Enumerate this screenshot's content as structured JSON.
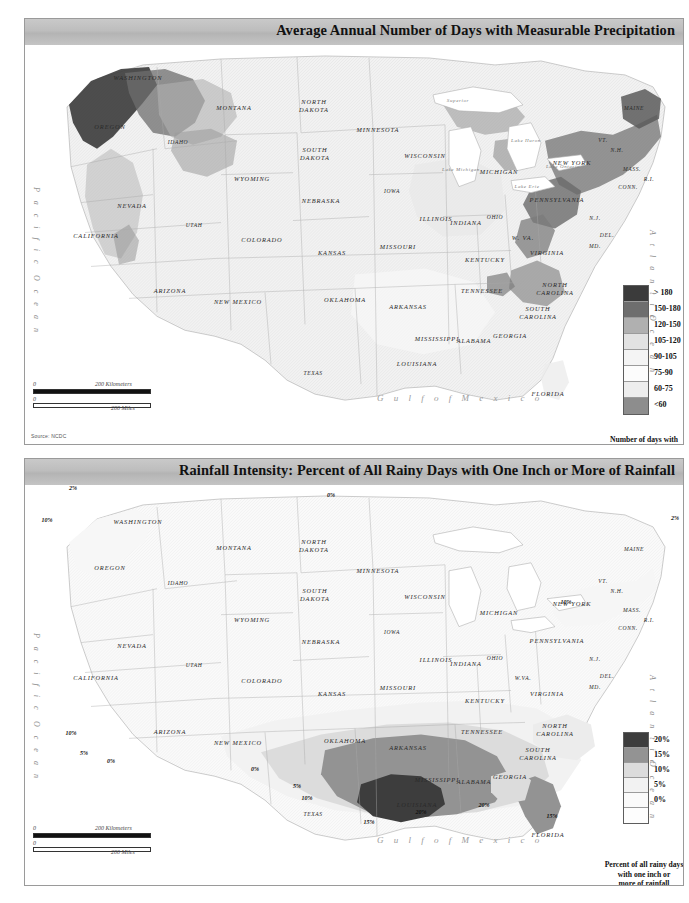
{
  "page": {
    "background": "#ffffff",
    "width": 689,
    "height": 903
  },
  "panels": [
    {
      "id": "precipitation-days",
      "title": "Average Annual Number of Days with Measurable Precipitation",
      "source": "Source: NCDC",
      "scale": {
        "zero": "0",
        "km": "200 Kilometers",
        "mi": "200 Miles"
      },
      "legend": {
        "caption": "Number of days with\nmeasurable precipitation",
        "bands": [
          {
            "label": "> 180",
            "color": "#3b3b3b"
          },
          {
            "label": "150-180",
            "color": "#6e6e6e"
          },
          {
            "label": "120-150",
            "color": "#b0b0b0"
          },
          {
            "label": "105-120",
            "color": "#e2e2e2"
          },
          {
            "label": "90-105",
            "color": "#f4f4f4"
          },
          {
            "label": "75-90",
            "color": "#fcfcfc"
          },
          {
            "label": "60-75",
            "color": "#ededed"
          },
          {
            "label": "<60",
            "color": "#8d8d8d"
          }
        ]
      }
    },
    {
      "id": "rainfall-intensity",
      "title": "Rainfall Intensity: Percent of All Rainy Days with One Inch or More of Rainfall",
      "source": "",
      "scale": {
        "zero": "0",
        "km": "200 Kilometers",
        "mi": "200 Miles"
      },
      "legend": {
        "caption": "Percent of all rainy days\nwith one inch or\nmore of rainfall",
        "bands": [
          {
            "label": "20%",
            "color": "#3d3d3d"
          },
          {
            "label": "15%",
            "color": "#939393"
          },
          {
            "label": "10%",
            "color": "#dcdcdc"
          },
          {
            "label": "5%",
            "color": "#f2f2f2"
          },
          {
            "label": "0%",
            "color": "#fafafa"
          },
          {
            "label": "",
            "color": "#fdfdfd"
          }
        ]
      }
    }
  ],
  "ocean_labels": {
    "pacific": "P a c i f i c",
    "atlantic": "A t l a n t i c",
    "ocean": "O c e a n",
    "gulf": "G u l f   o f   M e x i c o"
  },
  "states_top": [
    {
      "name": "WASHINGTON",
      "x": 113,
      "y": 32
    },
    {
      "name": "OREGON",
      "x": 85,
      "y": 81
    },
    {
      "name": "IDAHO",
      "x": 153,
      "y": 97
    },
    {
      "name": "MONTANA",
      "x": 209,
      "y": 62
    },
    {
      "name": "WYOMING",
      "x": 227,
      "y": 133
    },
    {
      "name": "NEVADA",
      "x": 107,
      "y": 160
    },
    {
      "name": "UTAH",
      "x": 169,
      "y": 180
    },
    {
      "name": "COLORADO",
      "x": 237,
      "y": 194
    },
    {
      "name": "CALIFORNIA",
      "x": 71,
      "y": 190
    },
    {
      "name": "ARIZONA",
      "x": 145,
      "y": 245
    },
    {
      "name": "NEW MEXICO",
      "x": 213,
      "y": 256
    },
    {
      "name": "TEXAS",
      "x": 288,
      "y": 328
    },
    {
      "name": "NORTH DAKOTA",
      "x": 289,
      "y": 60
    },
    {
      "name": "SOUTH DAKOTA",
      "x": 290,
      "y": 108
    },
    {
      "name": "NEBRASKA",
      "x": 296,
      "y": 155
    },
    {
      "name": "KANSAS",
      "x": 307,
      "y": 207
    },
    {
      "name": "OKLAHOMA",
      "x": 320,
      "y": 254
    },
    {
      "name": "MINNESOTA",
      "x": 353,
      "y": 84
    },
    {
      "name": "IOWA",
      "x": 367,
      "y": 146
    },
    {
      "name": "MISSOURI",
      "x": 373,
      "y": 201
    },
    {
      "name": "ARKANSAS",
      "x": 383,
      "y": 261
    },
    {
      "name": "LOUISIANA",
      "x": 392,
      "y": 318
    },
    {
      "name": "WISCONSIN",
      "x": 400,
      "y": 110
    },
    {
      "name": "ILLINOIS",
      "x": 411,
      "y": 173
    },
    {
      "name": "INDIANA",
      "x": 441,
      "y": 177
    },
    {
      "name": "MICHIGAN",
      "x": 474,
      "y": 126
    },
    {
      "name": "OHIO",
      "x": 470,
      "y": 172
    },
    {
      "name": "KENTUCKY",
      "x": 460,
      "y": 214
    },
    {
      "name": "TENNESSEE",
      "x": 457,
      "y": 245
    },
    {
      "name": "MISSISSIPPI",
      "x": 412,
      "y": 293
    },
    {
      "name": "ALABAMA",
      "x": 449,
      "y": 295
    },
    {
      "name": "GEORGIA",
      "x": 485,
      "y": 290
    },
    {
      "name": "FLORIDA",
      "x": 523,
      "y": 348
    },
    {
      "name": "SOUTH CAROLINA",
      "x": 513,
      "y": 267
    },
    {
      "name": "NORTH CAROLINA",
      "x": 530,
      "y": 243
    },
    {
      "name": "VIRGINIA",
      "x": 522,
      "y": 207
    },
    {
      "name": "W. VA.",
      "x": 498,
      "y": 192
    },
    {
      "name": "PENNSYLVANIA",
      "x": 532,
      "y": 154
    },
    {
      "name": "NEW YORK",
      "x": 547,
      "y": 117
    },
    {
      "name": "MAINE",
      "x": 609,
      "y": 63
    },
    {
      "name": "VT.",
      "x": 578,
      "y": 95
    },
    {
      "name": "N.H.",
      "x": 592,
      "y": 105
    },
    {
      "name": "MASS.",
      "x": 607,
      "y": 124
    },
    {
      "name": "CONN.",
      "x": 603,
      "y": 142
    },
    {
      "name": "R.I.",
      "x": 624,
      "y": 134
    },
    {
      "name": "N.J.",
      "x": 570,
      "y": 173
    },
    {
      "name": "DEL.",
      "x": 582,
      "y": 190
    },
    {
      "name": "MD.",
      "x": 570,
      "y": 201
    }
  ],
  "lakes_top": [
    {
      "name": "Superior",
      "x": 433,
      "y": 55
    },
    {
      "name": "Lake Michigan",
      "x": 436,
      "y": 124
    },
    {
      "name": "Lake Huron",
      "x": 501,
      "y": 95
    },
    {
      "name": "Lake Ontario",
      "x": 538,
      "y": 121
    },
    {
      "name": "Lake Erie",
      "x": 502,
      "y": 141
    }
  ],
  "states_bottom": [
    {
      "name": "WASHINGTON",
      "x": 113,
      "y": 36
    },
    {
      "name": "OREGON",
      "x": 85,
      "y": 82
    },
    {
      "name": "IDAHO",
      "x": 153,
      "y": 98
    },
    {
      "name": "MONTANA",
      "x": 209,
      "y": 62
    },
    {
      "name": "WYOMING",
      "x": 227,
      "y": 134
    },
    {
      "name": "NEVADA",
      "x": 107,
      "y": 160
    },
    {
      "name": "UTAH",
      "x": 169,
      "y": 180
    },
    {
      "name": "COLORADO",
      "x": 237,
      "y": 195
    },
    {
      "name": "CALIFORNIA",
      "x": 71,
      "y": 192
    },
    {
      "name": "ARIZONA",
      "x": 145,
      "y": 246
    },
    {
      "name": "NEW MEXICO",
      "x": 213,
      "y": 257
    },
    {
      "name": "TEXAS",
      "x": 288,
      "y": 329
    },
    {
      "name": "NORTH DAKOTA",
      "x": 289,
      "y": 60
    },
    {
      "name": "SOUTH DAKOTA",
      "x": 290,
      "y": 109
    },
    {
      "name": "NEBRASKA",
      "x": 296,
      "y": 156
    },
    {
      "name": "KANSAS",
      "x": 307,
      "y": 208
    },
    {
      "name": "OKLAHOMA",
      "x": 320,
      "y": 255
    },
    {
      "name": "MINNESOTA",
      "x": 353,
      "y": 85
    },
    {
      "name": "IOWA",
      "x": 367,
      "y": 147
    },
    {
      "name": "MISSOURI",
      "x": 373,
      "y": 202
    },
    {
      "name": "ARKANSAS",
      "x": 383,
      "y": 262
    },
    {
      "name": "LOUISIANA",
      "x": 392,
      "y": 319
    },
    {
      "name": "WISCONSIN",
      "x": 400,
      "y": 111
    },
    {
      "name": "ILLINOIS",
      "x": 411,
      "y": 174
    },
    {
      "name": "INDIANA",
      "x": 441,
      "y": 178
    },
    {
      "name": "MICHIGAN",
      "x": 474,
      "y": 127
    },
    {
      "name": "OHIO",
      "x": 470,
      "y": 173
    },
    {
      "name": "KENTUCKY",
      "x": 460,
      "y": 215
    },
    {
      "name": "TENNESSEE",
      "x": 457,
      "y": 246
    },
    {
      "name": "MISSISSIPPI",
      "x": 412,
      "y": 294
    },
    {
      "name": "ALABAMA",
      "x": 449,
      "y": 296
    },
    {
      "name": "GEORGIA",
      "x": 485,
      "y": 291
    },
    {
      "name": "FLORIDA",
      "x": 523,
      "y": 349
    },
    {
      "name": "SOUTH CAROLINA",
      "x": 513,
      "y": 268
    },
    {
      "name": "NORTH CAROLINA",
      "x": 530,
      "y": 244
    },
    {
      "name": "VIRGINIA",
      "x": 522,
      "y": 208
    },
    {
      "name": "W.VA.",
      "x": 498,
      "y": 193
    },
    {
      "name": "PENNSYLVANIA",
      "x": 532,
      "y": 155
    },
    {
      "name": "NEW YORK",
      "x": 547,
      "y": 118
    },
    {
      "name": "MAINE",
      "x": 609,
      "y": 64
    },
    {
      "name": "VT.",
      "x": 578,
      "y": 96
    },
    {
      "name": "N.H.",
      "x": 592,
      "y": 106
    },
    {
      "name": "MASS.",
      "x": 607,
      "y": 125
    },
    {
      "name": "CONN.",
      "x": 603,
      "y": 143
    },
    {
      "name": "R.I.",
      "x": 624,
      "y": 135
    },
    {
      "name": "N.J.",
      "x": 570,
      "y": 174
    },
    {
      "name": "DEL.",
      "x": 582,
      "y": 191
    },
    {
      "name": "MD.",
      "x": 570,
      "y": 202
    }
  ],
  "contour_labels": [
    {
      "value": "2%",
      "x": 48,
      "y": 3
    },
    {
      "value": "0%",
      "x": 75,
      "y": -2
    },
    {
      "value": "10%",
      "x": 22,
      "y": 35
    },
    {
      "value": "0%",
      "x": 306,
      "y": 10
    },
    {
      "value": "2%",
      "x": 650,
      "y": 33
    },
    {
      "value": "10%",
      "x": 541,
      "y": 117
    },
    {
      "value": "10%",
      "x": 46,
      "y": 248
    },
    {
      "value": "5%",
      "x": 59,
      "y": 268
    },
    {
      "value": "0%",
      "x": 86,
      "y": 276
    },
    {
      "value": "0%",
      "x": 230,
      "y": 284
    },
    {
      "value": "5%",
      "x": 272,
      "y": 301
    },
    {
      "value": "10%",
      "x": 282,
      "y": 313
    },
    {
      "value": "15%",
      "x": 344,
      "y": 337
    },
    {
      "value": "20%",
      "x": 396,
      "y": 327
    },
    {
      "value": "20%",
      "x": 459,
      "y": 320
    },
    {
      "value": "15%",
      "x": 527,
      "y": 331
    }
  ],
  "chart_data": {
    "type": "heatmap",
    "title": "Average Annual Number of Days with Measurable Precipitation",
    "categories": [
      "> 180",
      "150-180",
      "120-150",
      "105-120",
      "90-105",
      "75-90",
      "60-75",
      "<60"
    ],
    "legend_title": "Number of days with measurable precipitation",
    "second_map": {
      "type": "heatmap",
      "title": "Rainfall Intensity: Percent of All Rainy Days with One Inch or More of Rainfall",
      "categories": [
        "20%",
        "15%",
        "10%",
        "5%",
        "0%"
      ],
      "legend_title": "Percent of all rainy days with one inch or more of rainfall"
    }
  }
}
